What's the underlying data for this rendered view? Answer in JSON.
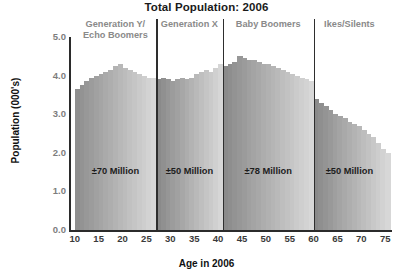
{
  "chart_data": {
    "type": "bar",
    "title": "Total Population: 2006",
    "xlabel": "Age in 2006",
    "ylabel": "Population (000's)",
    "xlim": [
      9,
      76
    ],
    "ylim": [
      0.0,
      5.0
    ],
    "grid": false,
    "legend": "none",
    "x_ticks": [
      "10",
      "15",
      "20",
      "25",
      "30",
      "35",
      "40",
      "45",
      "50",
      "55",
      "60",
      "65",
      "70",
      "75"
    ],
    "x_tick_values": [
      10,
      15,
      20,
      25,
      30,
      35,
      40,
      45,
      50,
      55,
      60,
      65,
      70,
      75
    ],
    "y_ticks": [
      "0.0",
      "1.0",
      "2.0",
      "3.0",
      "4.0",
      "5.0"
    ],
    "y_tick_values": [
      0.0,
      1.0,
      2.0,
      3.0,
      4.0,
      5.0
    ],
    "x": [
      10,
      11,
      12,
      13,
      14,
      15,
      16,
      17,
      18,
      19,
      20,
      21,
      22,
      23,
      24,
      25,
      26,
      27,
      28,
      29,
      30,
      31,
      32,
      33,
      34,
      35,
      36,
      37,
      38,
      39,
      40,
      41,
      42,
      43,
      44,
      45,
      46,
      47,
      48,
      49,
      50,
      51,
      52,
      53,
      54,
      55,
      56,
      57,
      58,
      59,
      60,
      61,
      62,
      63,
      64,
      65,
      66,
      67,
      68,
      69,
      70,
      71,
      72,
      73,
      74,
      75
    ],
    "values": [
      3.65,
      3.75,
      3.85,
      3.95,
      4.0,
      4.05,
      4.1,
      4.15,
      4.25,
      4.3,
      4.2,
      4.15,
      4.1,
      4.05,
      4.0,
      3.95,
      3.95,
      3.9,
      3.95,
      3.9,
      3.85,
      3.9,
      3.95,
      3.9,
      3.95,
      4.05,
      4.1,
      4.15,
      4.1,
      4.2,
      4.3,
      4.25,
      4.3,
      4.35,
      4.5,
      4.45,
      4.4,
      4.4,
      4.35,
      4.3,
      4.3,
      4.25,
      4.2,
      4.15,
      4.1,
      4.05,
      4.0,
      3.95,
      3.9,
      3.85,
      3.4,
      3.3,
      3.2,
      3.1,
      3.0,
      2.95,
      2.9,
      2.8,
      2.75,
      2.7,
      2.6,
      2.5,
      2.4,
      2.25,
      2.1,
      2.0
    ],
    "annotations": [
      {
        "label": "±70 Million",
        "x_range": [
          10,
          27
        ]
      },
      {
        "label": "±50 Million",
        "x_range": [
          27,
          41
        ]
      },
      {
        "label": "±78 Million",
        "x_range": [
          41,
          60
        ]
      },
      {
        "label": "±50 Million",
        "x_range": [
          60,
          75
        ]
      }
    ],
    "generations": [
      {
        "label": "Generation Y/\nEcho Boomers",
        "x_range": [
          10,
          27
        ]
      },
      {
        "label": "Generation X",
        "x_range": [
          27,
          41
        ]
      },
      {
        "label": "Baby Boomers",
        "x_range": [
          41,
          60
        ]
      },
      {
        "label": "Ikes/Silents",
        "x_range": [
          60,
          75
        ]
      }
    ],
    "dividers": [
      27,
      41,
      60
    ],
    "colors": {
      "bar_dark": "#8e8e8e",
      "bar_light": "#d8d8d8",
      "axis": "#2b2b2b",
      "tick_label": "#7d7d7d",
      "title": "#1a1a1a",
      "generation_label": "#8a8a8a",
      "annotation": "#1d1d1d"
    }
  }
}
